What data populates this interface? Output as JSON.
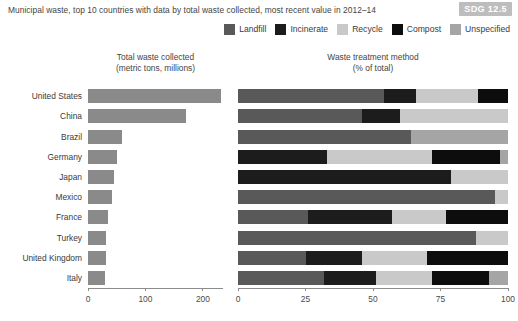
{
  "header": {
    "subtitle": "Municipal waste, top 10 countries with data by total waste collected, most recent value in 2012–14",
    "sdg_badge": "SDG 12.5"
  },
  "legend": {
    "items": [
      {
        "label": "Landfill",
        "color": "#595959"
      },
      {
        "label": "Incinerate",
        "color": "#1c1c1c"
      },
      {
        "label": "Recycle",
        "color": "#c9c9c9"
      },
      {
        "label": "Compost",
        "color": "#0d0d0d"
      },
      {
        "label": "Unspecified",
        "color": "#a5a5a5"
      }
    ]
  },
  "panels": {
    "left_title_line1": "Total waste collected",
    "left_title_line2": "(metric tons, millions)",
    "right_title_line1": "Waste treatment method",
    "right_title_line2": "(% of total)"
  },
  "chart_data": [
    {
      "type": "bar",
      "title": "Total waste collected (metric tons, millions)",
      "orientation": "horizontal",
      "xlabel": "",
      "ylabel": "",
      "xlim": [
        0,
        235
      ],
      "xticks": [
        0,
        100,
        200
      ],
      "xticklabels": [
        "0",
        "100",
        "200"
      ],
      "grid": false,
      "bar_color": "#8a8a8a",
      "categories": [
        "United States",
        "China",
        "Brazil",
        "Germany",
        "Japan",
        "Mexico",
        "France",
        "Turkey",
        "United Kingdom",
        "Italy"
      ],
      "values": [
        231,
        170,
        60,
        50,
        45,
        42,
        34,
        32,
        32,
        30
      ]
    },
    {
      "type": "bar",
      "subtype": "stacked-100",
      "title": "Waste treatment method (% of total)",
      "orientation": "horizontal",
      "xlabel": "",
      "ylabel": "",
      "xlim": [
        0,
        100
      ],
      "xticks": [
        0,
        25,
        50,
        75,
        100
      ],
      "xticklabels": [
        "0",
        "25",
        "50",
        "75",
        "100"
      ],
      "grid": false,
      "legend_position": "top-right",
      "categories": [
        "United States",
        "China",
        "Brazil",
        "Germany",
        "Japan",
        "Mexico",
        "France",
        "Turkey",
        "United Kingdom",
        "Italy"
      ],
      "series": [
        {
          "name": "Landfill",
          "color": "#595959",
          "values": [
            54,
            46,
            64,
            0,
            0,
            95,
            26,
            88,
            25,
            32
          ]
        },
        {
          "name": "Incinerate",
          "color": "#1c1c1c",
          "values": [
            12,
            14,
            0,
            33,
            79,
            0,
            31,
            0,
            21,
            19
          ]
        },
        {
          "name": "Recycle",
          "color": "#c9c9c9",
          "values": [
            23,
            40,
            0,
            39,
            21,
            5,
            20,
            12,
            24,
            21
          ]
        },
        {
          "name": "Compost",
          "color": "#0d0d0d",
          "values": [
            11,
            0,
            0,
            25,
            0,
            0,
            23,
            0,
            30,
            21
          ]
        },
        {
          "name": "Unspecified",
          "color": "#a5a5a5",
          "values": [
            0,
            0,
            36,
            3,
            0,
            0,
            0,
            0,
            0,
            7
          ]
        }
      ]
    }
  ]
}
